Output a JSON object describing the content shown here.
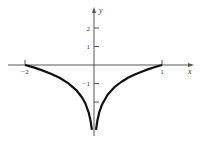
{
  "chart_data": {
    "type": "line",
    "title": "",
    "xlabel": "x",
    "ylabel": "y",
    "xlim": [
      -2,
      1
    ],
    "ylim": [
      -3.7,
      2.8
    ],
    "grid": false,
    "x_ticks": [
      {
        "value": -2,
        "label": "-2"
      },
      {
        "value": 1,
        "label": "1"
      }
    ],
    "y_ticks": [
      {
        "value": 2,
        "label": "2"
      },
      {
        "value": 1,
        "label": "1"
      },
      {
        "value": -1,
        "label": "-1"
      },
      {
        "value": -2,
        "label": ""
      }
    ],
    "series": [
      {
        "name": "left-branch",
        "x": [
          -2,
          -1.75,
          -1.5,
          -1.25,
          -1,
          -0.75,
          -0.5,
          -0.35,
          -0.25,
          -0.15,
          -0.1,
          -0.06
        ],
        "y": [
          0,
          -0.13,
          -0.29,
          -0.47,
          -0.69,
          -0.98,
          -1.39,
          -1.74,
          -2.08,
          -2.59,
          -3.0,
          -3.5
        ]
      },
      {
        "name": "right-branch",
        "x": [
          0.03,
          0.05,
          0.08,
          0.12,
          0.2,
          0.3,
          0.4,
          0.5,
          0.6,
          0.7,
          0.8,
          0.9,
          1
        ],
        "y": [
          -3.5,
          -3.0,
          -2.53,
          -2.12,
          -1.61,
          -1.2,
          -0.92,
          -0.69,
          -0.51,
          -0.36,
          -0.22,
          -0.11,
          0
        ]
      }
    ],
    "colors": {
      "curve": "#111111",
      "axis": "#555555"
    }
  }
}
